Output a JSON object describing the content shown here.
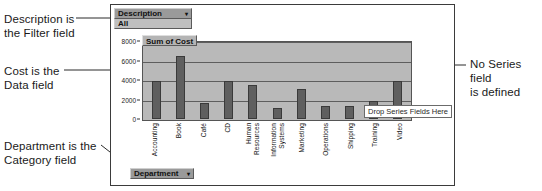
{
  "annotations": {
    "description": "Description is\nthe Filter field",
    "cost": "Cost is the\nData field",
    "department": "Department is the\nCategory field",
    "no_series": "No Series field\nis defined"
  },
  "pivot_chart": {
    "filter_field": {
      "label": "Description",
      "caret": "▾",
      "value": "All"
    },
    "data_field_caption": "Sum of Cost",
    "category_field": {
      "label": "Department",
      "caret": "▾"
    },
    "series_drop_zone": "Drop Series Fields Here"
  },
  "colors": {
    "plot_background": "#b9b9b9",
    "bar_fill": "#5f5f5f",
    "field_button": "#9a9a9a",
    "field_value": "#bfbfbf",
    "frame_border": "#3b3b3b"
  },
  "chart_data": {
    "type": "bar",
    "title": "Sum of Cost",
    "xlabel": "Department",
    "ylabel": "",
    "categories": [
      "Accounting",
      "Book",
      "Café",
      "CD",
      "Human\nResources",
      "Information\nSystems",
      "Marketing",
      "Operations",
      "Shipping",
      "Training",
      "Video"
    ],
    "values": [
      3900,
      6500,
      1600,
      3900,
      3500,
      1100,
      3100,
      1350,
      1300,
      1800,
      3850
    ],
    "ylim": [
      0,
      8000
    ],
    "yticks": [
      0,
      2000,
      4000,
      6000,
      8000
    ],
    "ytick_labels": [
      "0",
      "2000",
      "4000",
      "6000",
      "8000"
    ],
    "grid": true,
    "legend": false,
    "series": [
      {
        "name": "Sum of Cost",
        "values": [
          3900,
          6500,
          1600,
          3900,
          3500,
          1100,
          3100,
          1350,
          1300,
          1800,
          3850
        ]
      }
    ]
  }
}
